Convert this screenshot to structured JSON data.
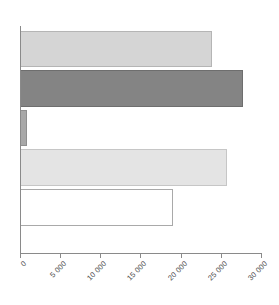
{
  "chart_data": {
    "type": "bar",
    "orientation": "horizontal",
    "title": "",
    "subtitle": "",
    "xlabel": "",
    "ylabel": "",
    "xlim": [
      0,
      30000
    ],
    "ylim": null,
    "grid": false,
    "legend": null,
    "tick_labels": [
      "0",
      "5 000",
      "10 000",
      "15 000",
      "20 000",
      "25 000",
      "30 000"
    ],
    "tick_values": [
      0,
      5000,
      10000,
      15000,
      20000,
      25000,
      30000
    ],
    "categories": [
      "",
      "",
      "",
      "",
      ""
    ],
    "values": [
      23800,
      27700,
      900,
      25600,
      19000
    ],
    "bar_colors": [
      "#d5d5d5",
      "#848484",
      "#a8a8a8",
      "#e4e4e4",
      "#ffffff"
    ],
    "bar_edge_colors": [
      "#b5b5b5",
      "#6e6e6e",
      "#8f8f8f",
      "#c6c6c6",
      "#a9a9a9"
    ],
    "axis_color": "#8a8a8a",
    "background": "#ffffff"
  },
  "axis": {
    "tick_label_0": "0",
    "tick_label_1": "5 000",
    "tick_label_2": "10 000",
    "tick_label_3": "15 000",
    "tick_label_4": "20 000",
    "tick_label_5": "25 000",
    "tick_label_6": "30 000"
  }
}
